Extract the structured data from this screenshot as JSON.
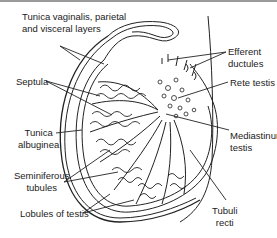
{
  "figure": {
    "labels": {
      "tunica_vaginalis_1": "Tunica vaginalis, parietal",
      "tunica_vaginalis_2": "and visceral layers",
      "efferent_1": "Efferent",
      "efferent_2": "ductules",
      "septula": "Septula",
      "rete_testis": "Rete testis",
      "tunica_albuginea_1": "Tunica",
      "tunica_albuginea_2": "albuginea",
      "mediastinum_1": "Mediastinum",
      "mediastinum_2": "testis",
      "seminiferous_1": "Seminiferous",
      "seminiferous_2": "tubules",
      "lobules": "Lobules of testis",
      "tubuli_1": "Tubuli",
      "tubuli_2": "recti"
    }
  },
  "colors": {
    "line": "#222222",
    "topbar": "#9a9a9a",
    "background": "#ffffff"
  }
}
